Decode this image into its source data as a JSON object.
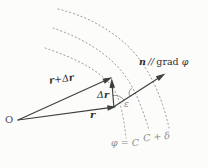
{
  "figure": {
    "background": "#fcfcfb",
    "colors": {
      "vector_stroke": "#3f3f3f",
      "level_curve_stroke": "#9a9a9a",
      "label_dark": "#2f2f2f",
      "label_light": "#8b8b8b"
    },
    "origin": {
      "label": "O"
    },
    "vectors": {
      "r": {
        "label": "r"
      },
      "r_plus_dr": {
        "r1": "r",
        "plus": "+",
        "delta": "Δ",
        "r2": "r"
      },
      "dr": {
        "delta": "Δ",
        "r": "r"
      },
      "n": {
        "n": "n",
        "parallel": "//",
        "grad": "grad",
        "phi": "φ"
      }
    },
    "angle": {
      "epsilon": "ε"
    },
    "level_curves": {
      "c_label": "φ = C",
      "c_plus_delta_label": "C + δ"
    }
  }
}
